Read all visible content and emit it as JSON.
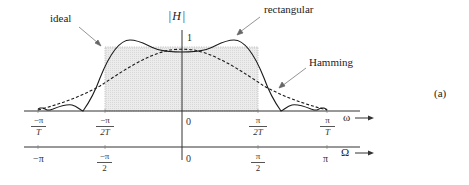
{
  "figure": {
    "panel_label": "(a)",
    "y_axis_label": "|H|",
    "unity_label": "1",
    "legend": {
      "ideal": "ideal",
      "rectangular": "rectangular",
      "hamming": "Hamming"
    },
    "omega_axis": {
      "symbol": "ω",
      "ticks": [
        {
          "num": "−π",
          "den": "T"
        },
        {
          "num": "−π",
          "den": "2T"
        },
        {
          "value": "0"
        },
        {
          "num": "π",
          "den": "2T"
        },
        {
          "num": "π",
          "den": "T"
        }
      ]
    },
    "Omega_axis": {
      "symbol": "Ω",
      "ticks": [
        {
          "value": "−π"
        },
        {
          "num": "−π",
          "den": "2"
        },
        {
          "value": "0"
        },
        {
          "num": "π",
          "den": "2"
        },
        {
          "value": "π"
        }
      ]
    },
    "colors": {
      "ideal_fill": "#e6e6e6",
      "curve": "#1a1a1a",
      "axis": "#333333"
    }
  }
}
